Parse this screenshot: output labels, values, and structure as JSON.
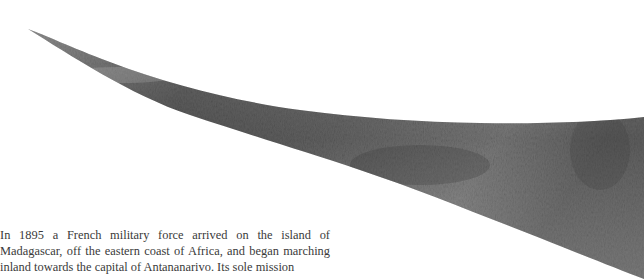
{
  "hero_image": {
    "subject": "rhinoceros-horn",
    "description": "Close-up of a curved grey textured horn spanning the top of the page",
    "colors": {
      "dark": "#3c3c3c",
      "mid": "#7a7a7a",
      "light": "#b5b5b5",
      "background": "#ffffff"
    }
  },
  "article": {
    "paragraph": "In 1895 a French military force arrived on the island of Madagascar, off the eastern coast of Africa, and began marching inland towards the capital of Antananarivo. Its sole mission"
  }
}
